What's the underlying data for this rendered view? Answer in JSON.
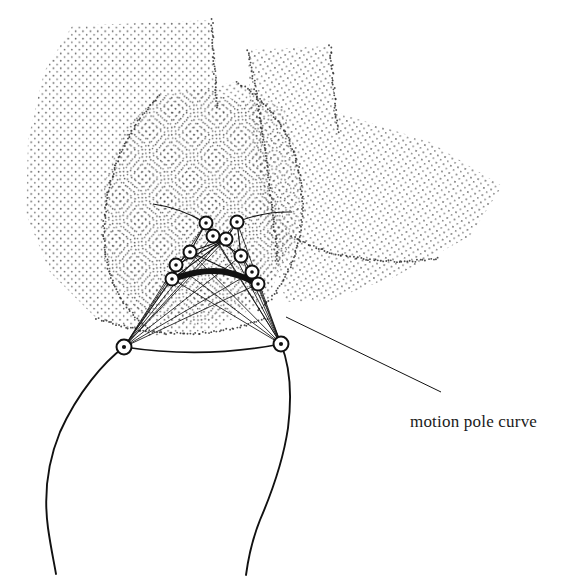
{
  "figure": {
    "background_color": "#ffffff",
    "ink_color": "#111111",
    "stipple_color": "#3a3a3a",
    "width": 576,
    "height": 578
  },
  "annotation": {
    "label": "motion pole curve",
    "label_x": 410,
    "label_y": 412,
    "leader_line": {
      "x1": 286,
      "y1": 317,
      "x2": 441,
      "y2": 392
    }
  },
  "pole_curve": {
    "name": "motion pole curve",
    "stroke_width": 6,
    "color": "#111111",
    "points": [
      [
        172,
        279
      ],
      [
        188,
        274
      ],
      [
        205,
        271
      ],
      [
        222,
        271
      ],
      [
        238,
        275
      ],
      [
        250,
        280
      ],
      [
        258,
        285
      ]
    ]
  },
  "base_pivots": [
    {
      "id": "A0",
      "x": 124,
      "y": 347
    },
    {
      "id": "B0",
      "x": 281,
      "y": 344
    }
  ],
  "joints": [
    {
      "id": "P1",
      "x": 206,
      "y": 223
    },
    {
      "id": "P2",
      "x": 237,
      "y": 222
    },
    {
      "id": "P3",
      "x": 213,
      "y": 236
    },
    {
      "id": "P4",
      "x": 226,
      "y": 239
    },
    {
      "id": "P5",
      "x": 190,
      "y": 252
    },
    {
      "id": "P6",
      "x": 241,
      "y": 256
    },
    {
      "id": "P7",
      "x": 176,
      "y": 265
    },
    {
      "id": "P8",
      "x": 252,
      "y": 272
    },
    {
      "id": "P9",
      "x": 172,
      "y": 279
    },
    {
      "id": "P10",
      "x": 258,
      "y": 284
    }
  ],
  "joint_style": {
    "outer_radius": 6.5,
    "ring_width": 2,
    "center_dot_radius": 1.8,
    "fill": "#ffffff",
    "stroke": "#111111"
  },
  "linkage_bars": [
    [
      "P1",
      "P3"
    ],
    [
      "P3",
      "P4"
    ],
    [
      "P4",
      "P2"
    ],
    [
      "P2",
      "P6"
    ],
    [
      "P1",
      "P5"
    ],
    [
      "P5",
      "P7"
    ],
    [
      "P7",
      "P9"
    ],
    [
      "P6",
      "P8"
    ],
    [
      "P8",
      "P10"
    ],
    [
      "P3",
      "P6"
    ],
    [
      "P4",
      "P5"
    ],
    [
      "P5",
      "P10"
    ],
    [
      "P9",
      "P4"
    ],
    [
      "P7",
      "P4"
    ]
  ],
  "whiskers": [
    {
      "from": "P1",
      "x2": 153,
      "y2": 204
    },
    {
      "from": "P2",
      "x2": 292,
      "y2": 212
    }
  ],
  "fan_from_A0": [
    "P1",
    "P2",
    "P3",
    "P4",
    "P5",
    "P6",
    "P7",
    "P8",
    "P9",
    "P10"
  ],
  "fan_from_B0": [
    "P1",
    "P2",
    "P3",
    "P4",
    "P5",
    "P6",
    "P7",
    "P8",
    "P9",
    "P10"
  ],
  "ground_arc": {
    "x1": 124,
    "y1": 347,
    "cx": 203,
    "cy": 359,
    "x2": 281,
    "y2": 344
  },
  "bone_outline": {
    "left_path": "M124,347 C104,362 78,392 60,432 C46,466 44,498 48,528 C51,549 54,562 56,574",
    "right_path": "M281,344 C290,366 292,396 288,428 C283,462 272,492 260,520 C252,540 248,560 246,575"
  },
  "stipple_regions": [
    {
      "name": "coupler-plane-left",
      "path": "M72,26 L212,20 L218,96 L262,104 L266,178 L292,236 L268,300 L212,330 L150,336 L96,318 L50,272 L26,214 L28,140 L44,72 Z",
      "dot_spacing": 7.4,
      "dot_radius": 0.85,
      "opacity": 0.82
    },
    {
      "name": "coupler-plane-right",
      "path": "M248,50 L330,46 L336,112 L430,142 L502,186 L470,236 L396,276 L330,300 L286,302 L272,252 L258,176 L250,110 Z",
      "dot_spacing": 7.4,
      "dot_radius": 0.85,
      "opacity": 0.82
    },
    {
      "name": "coupler-plane-center",
      "path": "M160,96 L236,82 L284,110 L302,176 L296,244 L258,300 L196,326 L138,312 L104,262 L104,184 L126,126 Z",
      "dot_spacing": 7.2,
      "dot_radius": 0.85,
      "opacity": 0.8
    }
  ],
  "stipple_edges": [
    "M160,96 C126,126 104,184 104,230 C104,276 122,310 150,330",
    "M236,82 C276,104 300,150 302,196 C304,248 286,290 256,312",
    "M248,50 C262,120 272,200 278,262",
    "M212,20 C214,70 216,96 218,110",
    "M330,46 C334,90 336,116 338,132",
    "M292,236 C320,254 380,268 440,258",
    "M96,318 C150,338 210,340 268,318"
  ]
}
